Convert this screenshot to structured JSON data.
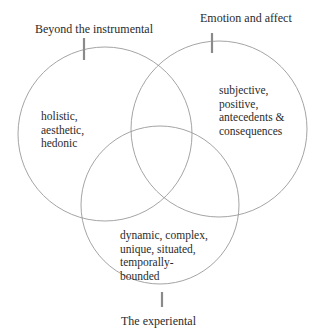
{
  "diagram": {
    "type": "venn",
    "sets": [
      {
        "id": "left",
        "title": "Beyond the instrumental",
        "description": "holistic,\naesthetic,\nhedonic"
      },
      {
        "id": "right",
        "title": "Emotion and affect",
        "description": "subjective,\npositive,\nantecedents &\nconsequences"
      },
      {
        "id": "bottom",
        "title": "The experiental",
        "description": "dynamic, complex,\nunique, situated,\ntemporally-\nbounded"
      }
    ],
    "colors": {
      "circle_stroke": "#9a9a9a",
      "tick": "#8a8a8a",
      "text": "#2b2b2b",
      "background": "#ffffff"
    }
  }
}
